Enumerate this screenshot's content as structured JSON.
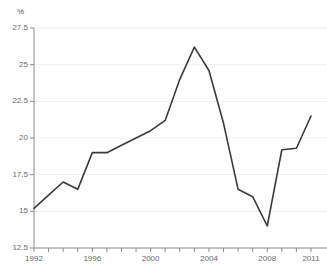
{
  "chart_data": {
    "type": "line",
    "title": "",
    "xlabel": "",
    "ylabel": "%",
    "unit_label": "%",
    "xlim": [
      1992,
      2011
    ],
    "ylim": [
      12.5,
      27.5
    ],
    "grid": true,
    "legend": "none",
    "x": [
      1992,
      1993,
      1994,
      1995,
      1996,
      1997,
      1998,
      1999,
      2000,
      2001,
      2002,
      2003,
      2004,
      2005,
      2006,
      2007,
      2008,
      2009,
      2010,
      2011
    ],
    "values": [
      15.2,
      16.1,
      17.0,
      16.5,
      19.0,
      19.0,
      19.5,
      20.0,
      20.5,
      21.2,
      24.0,
      26.2,
      24.6,
      21.0,
      16.5,
      16.0,
      14.0,
      19.2,
      19.3,
      21.5
    ],
    "series": [
      {
        "name": "series-1",
        "color": "#3a3a3a",
        "values": [
          15.2,
          16.1,
          17.0,
          16.5,
          19.0,
          19.0,
          19.5,
          20.0,
          20.5,
          21.2,
          24.0,
          26.2,
          24.6,
          21.0,
          16.5,
          16.0,
          14.0,
          19.2,
          19.3,
          21.5
        ]
      }
    ],
    "y_ticks": [
      12.5,
      15,
      17.5,
      20,
      22.5,
      25,
      27.5
    ],
    "y_tick_labels": [
      "12.5",
      "15",
      "17.5",
      "20",
      "22.5",
      "25",
      "27.5"
    ],
    "x_ticks": [
      1992,
      1993,
      1994,
      1995,
      1996,
      1997,
      1998,
      1999,
      2000,
      2001,
      2002,
      2003,
      2004,
      2005,
      2006,
      2007,
      2008,
      2009,
      2010,
      2011
    ],
    "x_tick_labels": [
      {
        "value": 1992,
        "label": "1992"
      },
      {
        "value": 1996,
        "label": "1996"
      },
      {
        "value": 2000,
        "label": "2000"
      },
      {
        "value": 2004,
        "label": "2004"
      },
      {
        "value": 2008,
        "label": "2008"
      },
      {
        "value": 2011,
        "label": "2011"
      }
    ],
    "colors": {
      "line": "#3a3a3a",
      "grid": "#efeff2",
      "axis": "#8a8a8a",
      "tick_text": "#6a6a6a",
      "background": "#ffffff"
    }
  },
  "header": {
    "faint_clipped_text": ""
  }
}
